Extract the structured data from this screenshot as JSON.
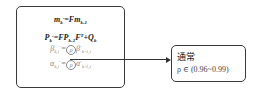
{
  "left_box": {
    "equations": [
      {
        "id": "eq1",
        "lhs": "m",
        "lhs_sub": "k",
        "lhs_sup": "-",
        "eq": "=",
        "rhs": "Fm",
        "rhs_sub": "k-1"
      },
      {
        "id": "eq2",
        "lhs": "P",
        "lhs_sub": "k",
        "lhs_sup": "-",
        "eq": "=",
        "rhs_a": "FP",
        "rhs_a_sub": "k-1",
        "rhs_b": "F",
        "rhs_b_sup": "T",
        "rhs_c": "+Q",
        "rhs_c_sub": "k"
      },
      {
        "id": "eq3",
        "lhs": "β",
        "lhs_sub": "k,i",
        "lhs_sup": "-",
        "eq": "=",
        "circ": "ρ",
        "rhs": "β",
        "rhs_sub": "k-1,i",
        "rhs_sup": "-"
      },
      {
        "id": "eq4",
        "lhs": "α",
        "lhs_sub": "k,i",
        "lhs_sup": "-",
        "eq": "=",
        "circ": "ρ",
        "rhs": "α",
        "rhs_sub": "k-1,i",
        "rhs_sup": "-"
      }
    ]
  },
  "right_box": {
    "title": "通常",
    "condition": "ρ ∈ (0.96~0.99)"
  },
  "connector": {
    "type": "arrow",
    "from": "left_box",
    "to": "right_box"
  }
}
